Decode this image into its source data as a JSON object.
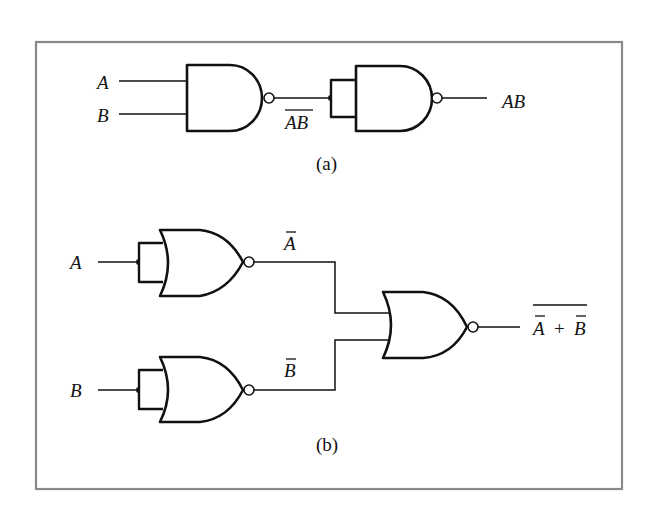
{
  "figure": {
    "frame_color": "#8a8a8a",
    "ink_color": "#111111",
    "background": "#ffffff"
  },
  "part_a": {
    "caption": "(a)",
    "input_a": "A",
    "input_b": "B",
    "intermediate": "AB",
    "intermediate_overline": true,
    "output": "AB",
    "gates": [
      "NAND",
      "NAND (inputs tied)"
    ]
  },
  "part_b": {
    "caption": "(b)",
    "input_a": "A",
    "input_b": "B",
    "not_a": "A",
    "not_b": "B",
    "output_term_a": "A",
    "output_plus": "+",
    "output_term_b": "B",
    "output_overline": true,
    "gates": [
      "NOR (inputs tied)",
      "NOR (inputs tied)",
      "NOR"
    ]
  }
}
